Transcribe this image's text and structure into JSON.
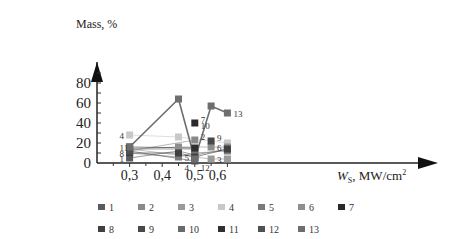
{
  "chart_data": {
    "type": "line",
    "title": "",
    "xlabel": "W_S, MW/cm²",
    "ylabel": "Mass, %",
    "x_ticks": [
      "0,3",
      "0,4",
      "0,5",
      "0,6"
    ],
    "y_ticks": [
      "0",
      "20",
      "40",
      "60",
      "80"
    ],
    "xlim": [
      0.2,
      0.65
    ],
    "ylim": [
      0,
      100
    ],
    "grid": false,
    "legend_position": "bottom",
    "series": [
      {
        "name": "1",
        "color": "#5a5a5a",
        "points": [
          [
            0.3,
            5
          ],
          [
            0.45,
            12
          ],
          [
            0.5,
            8
          ],
          [
            0.6,
            14
          ]
        ]
      },
      {
        "name": "2",
        "color": "#8a8a8a",
        "points": [
          [
            0.3,
            12
          ],
          [
            0.5,
            23
          ]
        ]
      },
      {
        "name": "3",
        "color": "#9a9a9a",
        "points": [
          [
            0.3,
            14
          ],
          [
            0.55,
            4
          ],
          [
            0.6,
            4
          ]
        ]
      },
      {
        "name": "4",
        "color": "#c8c8c8",
        "points": [
          [
            0.3,
            28
          ],
          [
            0.45,
            26
          ],
          [
            0.6,
            20
          ]
        ]
      },
      {
        "name": "5",
        "color": "#7a7a7a",
        "points": [
          [
            0.3,
            10
          ],
          [
            0.45,
            6
          ],
          [
            0.5,
            10
          ],
          [
            0.6,
            12
          ]
        ]
      },
      {
        "name": "6",
        "color": "#8e8e8e",
        "points": [
          [
            0.3,
            14
          ],
          [
            0.45,
            16
          ],
          [
            0.55,
            16
          ],
          [
            0.6,
            16
          ]
        ]
      },
      {
        "name": "7",
        "color": "#2a2a2a",
        "points": [
          [
            0.5,
            40
          ]
        ]
      },
      {
        "name": "8",
        "color": "#404040",
        "points": [
          [
            0.3,
            10
          ],
          [
            0.45,
            10
          ],
          [
            0.5,
            6
          ],
          [
            0.6,
            14
          ]
        ]
      },
      {
        "name": "9",
        "color": "#484848",
        "points": [
          [
            0.55,
            22
          ]
        ]
      },
      {
        "name": "10",
        "color": "#6a6a6a",
        "points": [
          [
            0.3,
            14
          ],
          [
            0.5,
            14
          ]
        ]
      },
      {
        "name": "11",
        "color": "#303030",
        "points": [
          [
            0.3,
            16
          ],
          [
            0.5,
            15
          ]
        ]
      },
      {
        "name": "12",
        "color": "#505050",
        "points": [
          [
            0.3,
            12
          ],
          [
            0.5,
            2
          ]
        ]
      },
      {
        "name": "13",
        "color": "#6e6e6e",
        "points": [
          [
            0.3,
            16
          ],
          [
            0.45,
            64
          ],
          [
            0.5,
            4
          ],
          [
            0.55,
            57
          ],
          [
            0.6,
            50
          ]
        ]
      }
    ],
    "point_labels": [
      {
        "text": "4",
        "x": 0.3,
        "y": 28
      },
      {
        "text": "11",
        "x": 0.3,
        "y": 16
      },
      {
        "text": "8",
        "x": 0.3,
        "y": 10
      },
      {
        "text": "1",
        "x": 0.3,
        "y": 5
      },
      {
        "text": "4",
        "x": 0.45,
        "y": -4
      },
      {
        "text": "5",
        "x": 0.45,
        "y": 6
      },
      {
        "text": "7",
        "x": 0.5,
        "y": 44
      },
      {
        "text": "10",
        "x": 0.5,
        "y": 38
      },
      {
        "text": "2",
        "x": 0.5,
        "y": 27
      },
      {
        "text": "12",
        "x": 0.5,
        "y": -4
      },
      {
        "text": "9",
        "x": 0.55,
        "y": 26
      },
      {
        "text": "6",
        "x": 0.55,
        "y": 16
      },
      {
        "text": "3",
        "x": 0.55,
        "y": 4
      },
      {
        "text": "13",
        "x": 0.6,
        "y": 50
      }
    ]
  },
  "legend": {
    "row1": [
      {
        "label": "1",
        "color": "#5a5a5a"
      },
      {
        "label": "2",
        "color": "#8a8a8a"
      },
      {
        "label": "3",
        "color": "#9a9a9a"
      },
      {
        "label": "4",
        "color": "#c8c8c8"
      },
      {
        "label": "5",
        "color": "#7a7a7a"
      },
      {
        "label": "6",
        "color": "#8e8e8e"
      },
      {
        "label": "7",
        "color": "#2a2a2a"
      }
    ],
    "row2": [
      {
        "label": "8",
        "color": "#404040"
      },
      {
        "label": "9",
        "color": "#484848"
      },
      {
        "label": "10",
        "color": "#6a6a6a"
      },
      {
        "label": "11",
        "color": "#303030"
      },
      {
        "label": "12",
        "color": "#505050"
      },
      {
        "label": "13",
        "color": "#6e6e6e"
      }
    ]
  }
}
